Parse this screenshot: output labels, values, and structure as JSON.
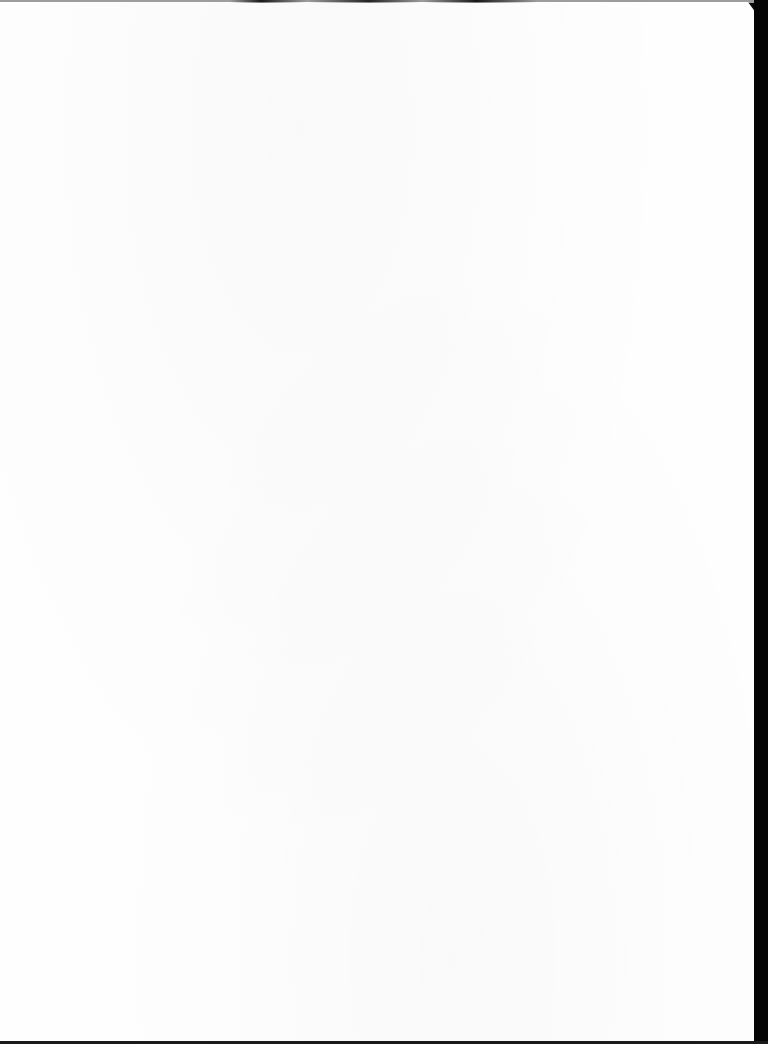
{
  "document": {
    "type": "scanned-page",
    "content": "",
    "page_color": "#fefefe",
    "border_color": "#050505"
  }
}
